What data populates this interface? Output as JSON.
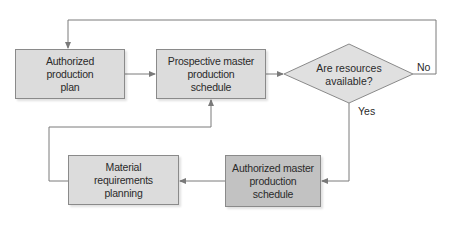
{
  "diagram": {
    "type": "flowchart",
    "nodes": [
      {
        "id": "app",
        "label": "Authorized production plan",
        "lines": [
          "Authorized",
          "production",
          "plan"
        ],
        "shape": "rectangle",
        "fill": "#dcdcdc"
      },
      {
        "id": "pmps",
        "label": "Prospective master production schedule",
        "lines": [
          "Prospective master",
          "production",
          "schedule"
        ],
        "shape": "rectangle",
        "fill": "#dcdcdc"
      },
      {
        "id": "decision",
        "label": "Are resources available?",
        "lines": [
          "Are resources",
          "available?"
        ],
        "shape": "diamond",
        "fill": "#e0e0e0"
      },
      {
        "id": "amps",
        "label": "Authorized master production schedule",
        "lines": [
          "Authorized master",
          "production",
          "schedule"
        ],
        "shape": "rectangle",
        "fill": "#c2c2c2"
      },
      {
        "id": "mrp",
        "label": "Material requirements planning",
        "lines": [
          "Material",
          "requirements",
          "planning"
        ],
        "shape": "rectangle",
        "fill": "#dcdcdc"
      }
    ],
    "edges": [
      {
        "from": "app",
        "to": "pmps",
        "label": ""
      },
      {
        "from": "pmps",
        "to": "decision",
        "label": ""
      },
      {
        "from": "decision",
        "to": "app",
        "label": "No"
      },
      {
        "from": "decision",
        "to": "amps",
        "label": "Yes"
      },
      {
        "from": "amps",
        "to": "mrp",
        "label": ""
      },
      {
        "from": "mrp",
        "to": "pmps",
        "label": ""
      }
    ],
    "edge_labels": {
      "no": "No",
      "yes": "Yes"
    },
    "colors": {
      "line": "#7a7a7a",
      "box_light": "#dcdcdc",
      "box_dark": "#c2c2c2",
      "text": "#2a2a2a"
    }
  }
}
